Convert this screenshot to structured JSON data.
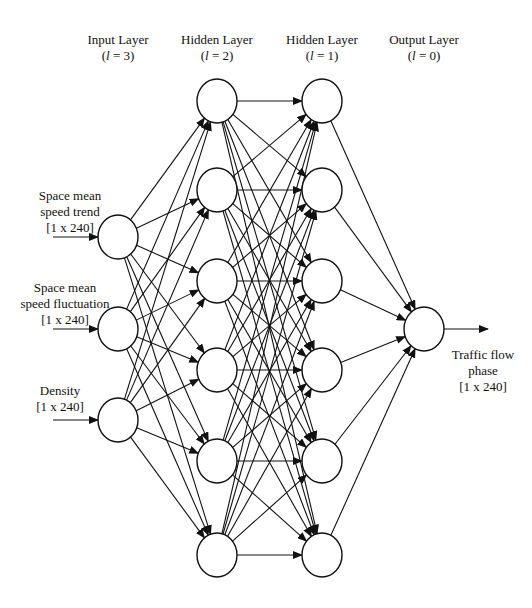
{
  "diagram": {
    "type": "neural-network",
    "layers": [
      {
        "id": "input",
        "title": "Input Layer",
        "index_label": "(l = 3)",
        "index_var": "l",
        "index_value": "3",
        "node_count": 3
      },
      {
        "id": "hidden2",
        "title": "Hidden Layer",
        "index_label": "(l = 2)",
        "index_var": "l",
        "index_value": "2",
        "node_count": 6
      },
      {
        "id": "hidden1",
        "title": "Hidden Layer",
        "index_label": "(l = 1)",
        "index_var": "l",
        "index_value": "1",
        "node_count": 6
      },
      {
        "id": "output",
        "title": "Output Layer",
        "index_label": "(l = 0)",
        "index_var": "l",
        "index_value": "0",
        "node_count": 1
      }
    ],
    "inputs": [
      {
        "line1": "Space mean",
        "line2": "speed trend",
        "dim": "[1 x 240]"
      },
      {
        "line1": "Space mean",
        "line2": "speed fluctuation",
        "dim": "[1 x 240]"
      },
      {
        "line1": "Density",
        "line2": "",
        "dim": "[1 x 240]"
      }
    ],
    "output": {
      "line1": "Traffic flow",
      "line2": "phase",
      "dim": "[1 x 240]"
    },
    "connections": "fully-connected between adjacent layers",
    "colors": {
      "stroke": "#111111",
      "background": "#ffffff"
    }
  }
}
